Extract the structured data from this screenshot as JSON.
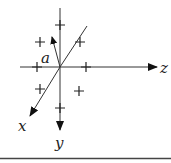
{
  "diagram": {
    "type": "3d-coordinate-axes",
    "axes": [
      {
        "name": "z",
        "label": "z",
        "direction": "right"
      },
      {
        "name": "y",
        "label": "y",
        "direction": "down"
      },
      {
        "name": "x",
        "label": "x",
        "direction": "down-left"
      }
    ],
    "vector": {
      "label": "a",
      "direction": "up-left"
    },
    "marks": {
      "symbol": "+",
      "count": 8
    },
    "colors": {
      "ink": "#222222",
      "background": "#ffffff"
    }
  }
}
